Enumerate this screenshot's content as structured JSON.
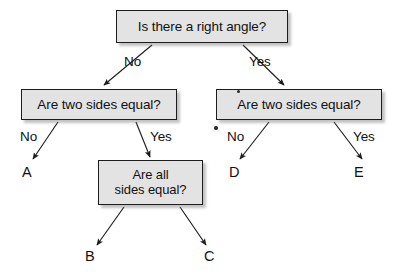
{
  "diagram": {
    "background_color": "#ffffff",
    "node_fill": "#e3e3e3",
    "node_border": "#1d1d1d",
    "text_color": "#111111",
    "nodes": [
      {
        "id": "root",
        "label": "Is there a right angle?"
      },
      {
        "id": "left",
        "label": "Are two sides equal?"
      },
      {
        "id": "right",
        "label": "Are two sides equal?"
      },
      {
        "id": "bottom",
        "label": "Are all\nsides equal?"
      }
    ],
    "edge_labels": [
      {
        "id": "root-no",
        "label": "No"
      },
      {
        "id": "root-yes",
        "label": "Yes"
      },
      {
        "id": "left-no",
        "label": "No"
      },
      {
        "id": "left-yes",
        "label": "Yes"
      },
      {
        "id": "right-no",
        "label": "No"
      },
      {
        "id": "right-yes",
        "label": "Yes"
      }
    ],
    "terminals": [
      {
        "id": "a",
        "label": "A"
      },
      {
        "id": "b",
        "label": "B"
      },
      {
        "id": "c",
        "label": "C"
      },
      {
        "id": "d",
        "label": "D"
      },
      {
        "id": "e",
        "label": "E"
      }
    ]
  }
}
